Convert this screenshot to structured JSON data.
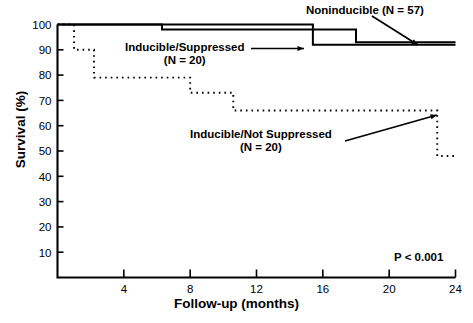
{
  "chart_data": {
    "type": "line",
    "title": "",
    "subtitle": "",
    "xlabel": "Follow-up (months)",
    "ylabel": "Survival (%)",
    "xlim": [
      0,
      24
    ],
    "ylim": [
      0,
      100
    ],
    "xticks": [
      4,
      8,
      12,
      16,
      20,
      24
    ],
    "yticks": [
      10,
      20,
      30,
      40,
      50,
      60,
      70,
      80,
      90,
      100
    ],
    "grid": false,
    "legend_position": "inline-annotations",
    "style": "kaplan-meier step curves",
    "annotations": [
      {
        "name": "noninducible-label",
        "text": "Noninducible (N = 57)",
        "has_leader_line": true
      },
      {
        "name": "inducible-suppressed-label",
        "line1": "Inducible/Suppressed",
        "line2": "(N = 20)",
        "has_leader_line": true
      },
      {
        "name": "inducible-not-suppressed-label",
        "line1": "Inducible/Not Suppressed",
        "line2": "(N = 20)",
        "has_leader_line": true
      },
      {
        "name": "p-value-label",
        "text": "P < 0.001"
      }
    ],
    "series": [
      {
        "name": "Noninducible (N = 57)",
        "n": 57,
        "linestyle": "solid",
        "color": "#000000",
        "steps": [
          {
            "x": 0.0,
            "y": 100
          },
          {
            "x": 6.3,
            "y": 100
          },
          {
            "x": 6.3,
            "y": 98
          },
          {
            "x": 18.0,
            "y": 98
          },
          {
            "x": 18.0,
            "y": 93
          },
          {
            "x": 24.0,
            "y": 93
          }
        ]
      },
      {
        "name": "Inducible/Suppressed (N = 20)",
        "n": 20,
        "linestyle": "solid",
        "color": "#000000",
        "steps": [
          {
            "x": 0.0,
            "y": 100
          },
          {
            "x": 15.4,
            "y": 100
          },
          {
            "x": 15.4,
            "y": 92
          },
          {
            "x": 24.0,
            "y": 92
          }
        ]
      },
      {
        "name": "Inducible/Not Suppressed (N = 20)",
        "n": 20,
        "linestyle": "dotted",
        "color": "#000000",
        "steps": [
          {
            "x": 0.0,
            "y": 100
          },
          {
            "x": 1.0,
            "y": 100
          },
          {
            "x": 1.0,
            "y": 90
          },
          {
            "x": 2.2,
            "y": 90
          },
          {
            "x": 2.2,
            "y": 79
          },
          {
            "x": 8.0,
            "y": 79
          },
          {
            "x": 8.0,
            "y": 73
          },
          {
            "x": 10.6,
            "y": 73
          },
          {
            "x": 10.6,
            "y": 66
          },
          {
            "x": 22.9,
            "y": 66
          },
          {
            "x": 22.9,
            "y": 48
          },
          {
            "x": 24.0,
            "y": 48
          }
        ]
      }
    ],
    "p_value": "P < 0.001"
  },
  "labels": {
    "xlabel": "Follow-up (months)",
    "ylabel": "Survival (%)",
    "noninducible": "Noninducible (N = 57)",
    "suppressed_line1": "Inducible/Suppressed",
    "suppressed_line2": "(N = 20)",
    "notsuppressed_line1": "Inducible/Not Suppressed",
    "notsuppressed_line2": "(N = 20)",
    "pvalue": "P < 0.001"
  },
  "colors": {
    "axis": "#000000",
    "curve": "#000000",
    "background": "#ffffff"
  }
}
